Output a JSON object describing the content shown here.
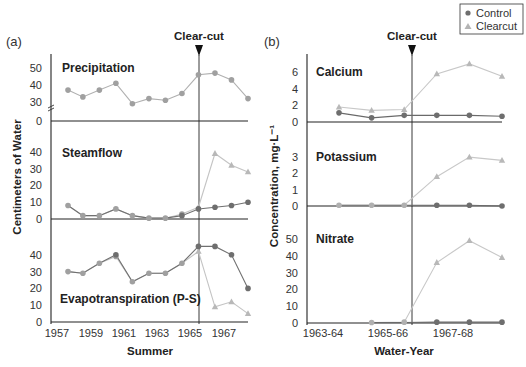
{
  "legend": {
    "items": [
      {
        "label": "Control",
        "marker": "circle",
        "color": "#6e6e6e"
      },
      {
        "label": "Clearcut",
        "marker": "triangle",
        "color": "#b4b4b4"
      }
    ]
  },
  "colors": {
    "control": "#6e6e6e",
    "control_stroke": "#5a5a5a",
    "clearcut": "#b8b8b8",
    "shared": "#a0a0a0",
    "axis": "#222222"
  },
  "panel_a": {
    "label": "(a)",
    "clearcut_label": "Clear-cut",
    "ylabel": "Centimeters of Water",
    "xlabel": "Summer",
    "xticks": [
      "1957",
      "1959",
      "1961",
      "1963",
      "1965",
      "1967"
    ]
  },
  "panel_b": {
    "label": "(b)",
    "clearcut_label": "Clear-cut",
    "ylabel": "Concentration, mg·L⁻¹",
    "xlabel": "Water-Year",
    "xticks": [
      "1963-64",
      "1965-66",
      "1967-68"
    ]
  },
  "chart_data": [
    {
      "type": "line",
      "panel": "(a)",
      "title": "Precipitation",
      "xlabel": "Summer",
      "ylabel": "Centimeters of Water",
      "x": [
        1957.7,
        1958.6,
        1959.6,
        1960.6,
        1961.6,
        1962.6,
        1963.6,
        1964.6,
        1965.6,
        1966.6,
        1967.6,
        1968.6
      ],
      "yticks": [
        0,
        30,
        40,
        50
      ],
      "axis_break": true,
      "series": [
        {
          "name": "Control/Clearcut (shared)",
          "values": [
            37,
            33,
            37,
            41,
            29,
            32,
            31,
            35,
            46,
            47,
            43,
            32
          ]
        }
      ],
      "clearcut_x": 1965.6
    },
    {
      "type": "line",
      "panel": "(a)",
      "title": "Steamflow",
      "xlabel": "Summer",
      "ylabel": "Centimeters of Water",
      "x": [
        1957.7,
        1958.6,
        1959.6,
        1960.6,
        1961.6,
        1962.6,
        1963.6,
        1964.6,
        1965.6,
        1966.6,
        1967.6,
        1968.6
      ],
      "yticks": [
        0,
        10,
        20,
        30,
        40
      ],
      "ylim": [
        0,
        40
      ],
      "series": [
        {
          "name": "Control",
          "values": [
            8,
            2,
            2,
            6,
            2,
            0.5,
            0.5,
            2,
            6,
            7,
            8,
            10
          ]
        },
        {
          "name": "Clearcut",
          "values": [
            8,
            2,
            2,
            6,
            2,
            0.5,
            0.5,
            3,
            7,
            39,
            32,
            28
          ]
        }
      ],
      "clearcut_x": 1965.6
    },
    {
      "type": "line",
      "panel": "(a)",
      "title": "Evapotranspiration (P-S)",
      "xlabel": "Summer",
      "ylabel": "Centimeters of Water",
      "x": [
        1957.7,
        1958.6,
        1959.6,
        1960.6,
        1961.6,
        1962.6,
        1963.6,
        1964.6,
        1965.6,
        1966.6,
        1967.6,
        1968.6
      ],
      "yticks": [
        0,
        10,
        20,
        30,
        40
      ],
      "ylim": [
        0,
        40
      ],
      "series": [
        {
          "name": "Control",
          "values": [
            30,
            29,
            35,
            40,
            24,
            29,
            29,
            35,
            45,
            45,
            40,
            20
          ]
        },
        {
          "name": "Clearcut",
          "values": [
            30,
            29,
            35,
            39,
            24,
            29,
            29,
            35,
            42,
            9,
            12,
            5
          ]
        }
      ],
      "clearcut_x": 1965.6
    },
    {
      "type": "line",
      "panel": "(b)",
      "title": "Calcium",
      "xlabel": "Water-Year",
      "ylabel": "Concentration, mg·L⁻¹",
      "x": [
        "1964-65a",
        "1964-65b",
        "1965-66",
        "1966-67",
        "1967-68",
        "1968-69"
      ],
      "x_positions": [
        1,
        2,
        3,
        4,
        5,
        6
      ],
      "yticks": [
        0,
        2,
        4,
        6
      ],
      "ylim": [
        0,
        7
      ],
      "series": [
        {
          "name": "Control",
          "values": [
            1.1,
            0.5,
            0.8,
            0.8,
            0.8,
            0.7
          ]
        },
        {
          "name": "Clearcut",
          "values": [
            1.8,
            1.4,
            1.5,
            5.8,
            7.0,
            5.5
          ]
        }
      ],
      "clearcut_x": 3.25
    },
    {
      "type": "line",
      "panel": "(b)",
      "title": "Potassium",
      "xlabel": "Water-Year",
      "ylabel": "Concentration, mg·L⁻¹",
      "x_positions": [
        1,
        2,
        3,
        4,
        5,
        6
      ],
      "yticks": [
        0,
        1,
        2,
        3
      ],
      "ylim": [
        0,
        3.5
      ],
      "series": [
        {
          "name": "Control",
          "values": [
            0.05,
            0.05,
            0.05,
            0.05,
            0.05,
            0.0
          ]
        },
        {
          "name": "Clearcut",
          "values": [
            0.05,
            0.05,
            0.05,
            1.8,
            3.0,
            2.8
          ]
        }
      ],
      "clearcut_x": 3.25
    },
    {
      "type": "line",
      "panel": "(b)",
      "title": "Nitrate",
      "xlabel": "Water-Year",
      "ylabel": "Concentration, mg·L⁻¹",
      "x_positions": [
        2,
        3,
        4,
        5,
        6
      ],
      "yticks": [
        0,
        10,
        20,
        30,
        40,
        50
      ],
      "ylim": [
        0,
        55
      ],
      "series": [
        {
          "name": "Control",
          "values": [
            0.3,
            0.3,
            0.5,
            0.5,
            0.5
          ]
        },
        {
          "name": "Clearcut",
          "values": [
            0.3,
            0.5,
            36,
            49,
            39
          ]
        }
      ],
      "clearcut_x": 3.25
    }
  ]
}
